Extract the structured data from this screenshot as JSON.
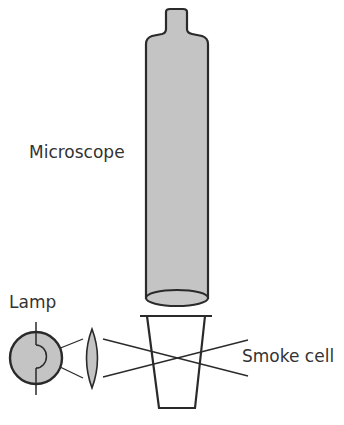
{
  "diagram": {
    "type": "apparatus schematic",
    "labels": {
      "microscope": "Microscope",
      "lamp": "Lamp",
      "smoke_cell": "Smoke cell"
    },
    "colors": {
      "fill": "#c4c4c4",
      "stroke": "#2a2a2a",
      "text": "#333333",
      "background": "#ffffff"
    }
  }
}
